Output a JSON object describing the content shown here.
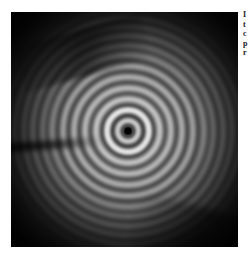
{
  "page": {
    "background_color": "#ffffff"
  },
  "figure": {
    "name": "interference-fringe-image",
    "panel_background": "#000000",
    "center": {
      "x": 117,
      "y": 119
    },
    "artifacts": [
      "diagonal dark streak upper-left",
      "horizontal dark streak mid-left edge",
      "dark sweep lower-right corner"
    ]
  },
  "chart_data": {
    "type": "heatmap",
    "title": "",
    "subtitle": "",
    "xlabel": "",
    "ylabel": "",
    "grid": false,
    "legend": "none",
    "pattern": "concentric-rings",
    "center": {
      "x": 117,
      "y": 119
    },
    "colormap": "grayscale",
    "value_min": 0,
    "value_max": 255,
    "rings": [
      {
        "index": 1,
        "radius": 8,
        "intensity": 210,
        "thickness": 5
      },
      {
        "index": 2,
        "radius": 18,
        "intensity": 236,
        "thickness": 6
      },
      {
        "index": 3,
        "radius": 29,
        "intensity": 222,
        "thickness": 6
      },
      {
        "index": 4,
        "radius": 40,
        "intensity": 206,
        "thickness": 6
      },
      {
        "index": 5,
        "radius": 51,
        "intensity": 196,
        "thickness": 6
      },
      {
        "index": 6,
        "radius": 62,
        "intensity": 184,
        "thickness": 6
      },
      {
        "index": 7,
        "radius": 73,
        "intensity": 172,
        "thickness": 6
      },
      {
        "index": 8,
        "radius": 83,
        "intensity": 158,
        "thickness": 5
      },
      {
        "index": 9,
        "radius": 93,
        "intensity": 144,
        "thickness": 5
      },
      {
        "index": 10,
        "radius": 102,
        "intensity": 128,
        "thickness": 5
      },
      {
        "index": 11,
        "radius": 111,
        "intensity": 112,
        "thickness": 5
      },
      {
        "index": 12,
        "radius": 120,
        "intensity": 96,
        "thickness": 5
      },
      {
        "index": 13,
        "radius": 129,
        "intensity": 80,
        "thickness": 4
      },
      {
        "index": 14,
        "radius": 137,
        "intensity": 64,
        "thickness": 4
      },
      {
        "index": 15,
        "radius": 145,
        "intensity": 50,
        "thickness": 4
      },
      {
        "index": 16,
        "radius": 153,
        "intensity": 38,
        "thickness": 4
      }
    ],
    "core": {
      "radius": 4,
      "intensity": 0
    }
  },
  "caption": {
    "truncated": true,
    "lines": [
      "I",
      "t",
      "c",
      "p",
      "r"
    ]
  }
}
